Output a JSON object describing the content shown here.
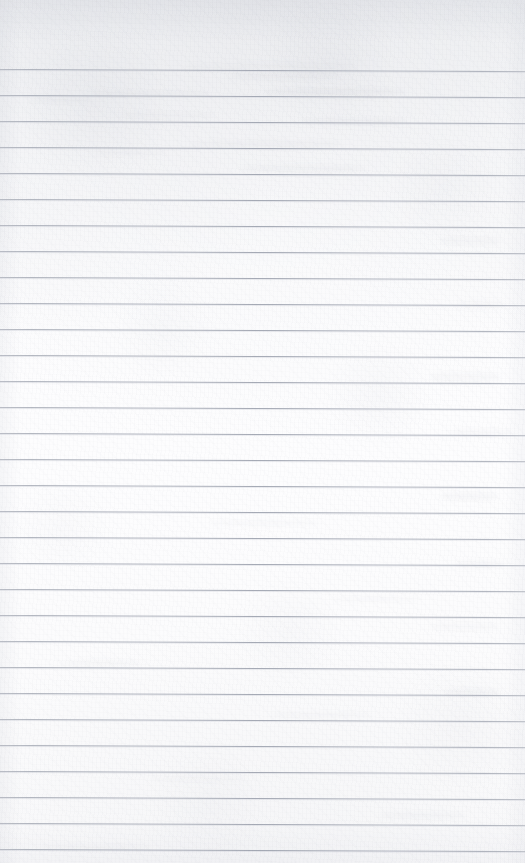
{
  "document": {
    "kind": "scanned-ruled-notebook-page",
    "title": "Blank Ruled Notebook Page",
    "content_text": "",
    "has_written_content": false,
    "has_margin_line": false,
    "orientation": "portrait",
    "page_width_px": 525,
    "page_height_px": 863
  },
  "paper": {
    "background_color": "#fbfbfc",
    "top_shadow_color": "#e4e5e9",
    "texture": "fibrous-scan-grain",
    "scan_skew_degrees": 0.22
  },
  "ruling": {
    "line_color": "#a2a7b2",
    "line_thickness_px": 1,
    "line_spacing_px": 26,
    "first_line_y_px": 69,
    "line_count": 31,
    "left_inset_px": 0,
    "right_inset_px": 0,
    "line_y_positions": [
      69,
      95,
      121,
      147,
      173,
      199,
      225,
      251,
      277,
      303,
      329,
      355,
      381,
      407,
      433,
      459,
      485,
      511,
      537,
      563,
      589,
      615,
      641,
      667,
      693,
      719,
      745,
      771,
      797,
      823,
      849
    ]
  },
  "ghosting": {
    "description": "faint illegible bleed-through from reverse side",
    "color": "#c4c6ce",
    "marks": [
      {
        "x": 185,
        "y": 62,
        "w": 170,
        "h": 9
      },
      {
        "x": 230,
        "y": 72,
        "w": 110,
        "h": 8
      },
      {
        "x": 90,
        "y": 90,
        "w": 120,
        "h": 7
      },
      {
        "x": 265,
        "y": 88,
        "w": 140,
        "h": 8
      },
      {
        "x": 30,
        "y": 98,
        "w": 60,
        "h": 5
      },
      {
        "x": 120,
        "y": 112,
        "w": 95,
        "h": 7
      },
      {
        "x": 300,
        "y": 118,
        "w": 105,
        "h": 7
      },
      {
        "x": 190,
        "y": 140,
        "w": 150,
        "h": 8
      },
      {
        "x": 95,
        "y": 150,
        "w": 70,
        "h": 6
      },
      {
        "x": 240,
        "y": 165,
        "w": 125,
        "h": 7
      },
      {
        "x": 440,
        "y": 236,
        "w": 60,
        "h": 10
      },
      {
        "x": 455,
        "y": 300,
        "w": 50,
        "h": 9
      },
      {
        "x": 430,
        "y": 372,
        "w": 70,
        "h": 10
      },
      {
        "x": 450,
        "y": 428,
        "w": 62,
        "h": 9
      },
      {
        "x": 440,
        "y": 492,
        "w": 58,
        "h": 9
      },
      {
        "x": 455,
        "y": 560,
        "w": 50,
        "h": 8
      },
      {
        "x": 430,
        "y": 622,
        "w": 68,
        "h": 9
      },
      {
        "x": 445,
        "y": 688,
        "w": 55,
        "h": 8
      },
      {
        "x": 210,
        "y": 520,
        "w": 110,
        "h": 6
      },
      {
        "x": 330,
        "y": 596,
        "w": 90,
        "h": 6
      },
      {
        "x": 60,
        "y": 660,
        "w": 80,
        "h": 6
      },
      {
        "x": 270,
        "y": 712,
        "w": 100,
        "h": 6
      },
      {
        "x": 150,
        "y": 776,
        "w": 95,
        "h": 6
      },
      {
        "x": 380,
        "y": 812,
        "w": 85,
        "h": 7
      },
      {
        "x": 40,
        "y": 844,
        "w": 110,
        "h": 6
      }
    ]
  }
}
